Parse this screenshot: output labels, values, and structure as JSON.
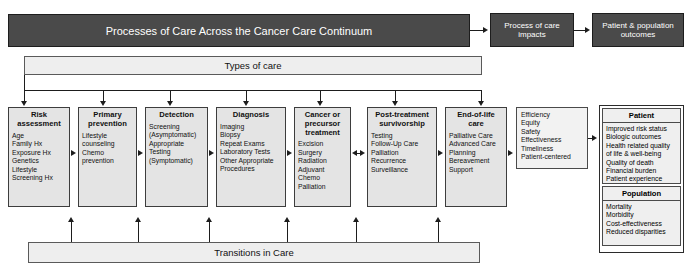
{
  "banner": {
    "title": "Processes of Care Across the Cancer Care Continuum",
    "impacts": "Process of care impacts",
    "outcomes": "Patient & population outcomes"
  },
  "bars": {
    "types_of_care": "Types of care",
    "transitions_in_care": "Transitions in Care"
  },
  "stages": [
    {
      "name": "risk-assessment",
      "title": "Risk assessment",
      "items": "Age\nFamily Hx\nExposure Hx\nGenetics\nLifestyle\nScreening Hx"
    },
    {
      "name": "primary-prevention",
      "title": "Primary prevention",
      "items": "Lifestyle counseling\nChemo prevention"
    },
    {
      "name": "detection",
      "title": "Detection",
      "items": "Screening (Asymptomatic)\nAppropriate Testing (Symptomatic)"
    },
    {
      "name": "diagnosis",
      "title": "Diagnosis",
      "items": "Imaging\nBiopsy\nRepeat Exams\nLaboratory Tests\nOther Appropriate Procedures"
    },
    {
      "name": "cancer-or-precursor-treatment",
      "title": "Cancer or precursor treatment",
      "items": "Excision\nSurgery\nRadiation\nAdjuvant\nChemo\nPalliation"
    },
    {
      "name": "post-treatment-survivorship",
      "title": "Post-treatment survivorship",
      "items": "Testing\nFollow-Up Care\nPalliation\nRecurrence\nSurveillance"
    },
    {
      "name": "end-of-life-care",
      "title": "End-of-life care",
      "items": "Palliative Care\nAdvanced Care Planning\nBereavement Support"
    }
  ],
  "quality_domains": {
    "name": "quality-domains",
    "items": "Efficiency\nEquity\nSafety\nEffectiveness\nTimeliness\nPatient-centered"
  },
  "outcomes": {
    "patient": {
      "title": "Patient",
      "items": "Improved risk status\nBiologic outcomes\nHealth related quality of life & well-being\nQuality of death\nFinancial burden\nPatient experience"
    },
    "population": {
      "title": "Population",
      "items": "Mortality\nMorbidity\nCost-effectiveness\nReduced disparities"
    }
  },
  "colors": {
    "banner_dark": "#4a4a4a",
    "bar_light": "#eeeeee",
    "box_fill": "#e4e4e4",
    "stroke": "#1d1d1d"
  }
}
